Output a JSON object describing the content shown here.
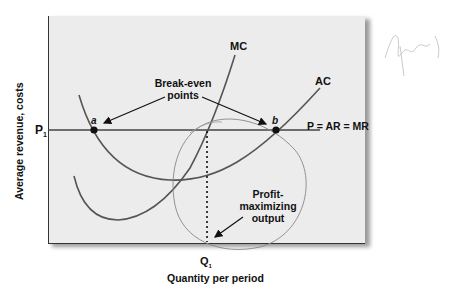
{
  "diagram": {
    "y_axis_label": "Average revenue, costs",
    "x_axis_label": "Quantity per period",
    "price_tick": "P",
    "price_tick_sub": "1",
    "quantity_tick": "Q",
    "quantity_tick_sub": "1",
    "curves": {
      "mc": "MC",
      "ac": "AC",
      "price_line": "P = AR = MR"
    },
    "points": {
      "a": "a",
      "b": "b"
    },
    "annotations": {
      "break_even_line1": "Break-even",
      "break_even_line2": "points",
      "profit_line1": "Profit-",
      "profit_line2": "maximizing",
      "profit_line3": "output"
    },
    "colors": {
      "panel": "#ececec",
      "curve": "#555555",
      "text": "#111111",
      "handdrawn": "#888888"
    }
  }
}
